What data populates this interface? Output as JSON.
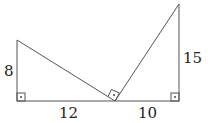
{
  "diagram": {
    "labels": {
      "left_height": "8",
      "left_base": "12",
      "right_base": "10",
      "right_height": "15"
    },
    "colors": {
      "line": "#555555",
      "text": "#222222",
      "background": "#ffffff"
    }
  }
}
